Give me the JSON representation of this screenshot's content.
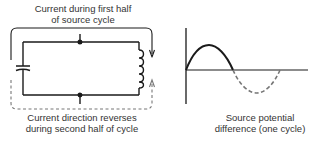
{
  "circuit": {
    "top_caption_line1": "Current during first half",
    "top_caption_line2": "of source cycle",
    "bottom_caption_line1": "Current direction reverses",
    "bottom_caption_line2": "during second half of cycle",
    "components": [
      "capacitor",
      "inductor",
      "source-terminals"
    ]
  },
  "graph": {
    "caption_line1": "Source potential",
    "caption_line2": "difference (one cycle)",
    "first_half_style": "solid",
    "second_half_style": "dashed"
  },
  "colors": {
    "line": "#1a1a1a",
    "dashed": "#777777",
    "text": "#333333"
  }
}
